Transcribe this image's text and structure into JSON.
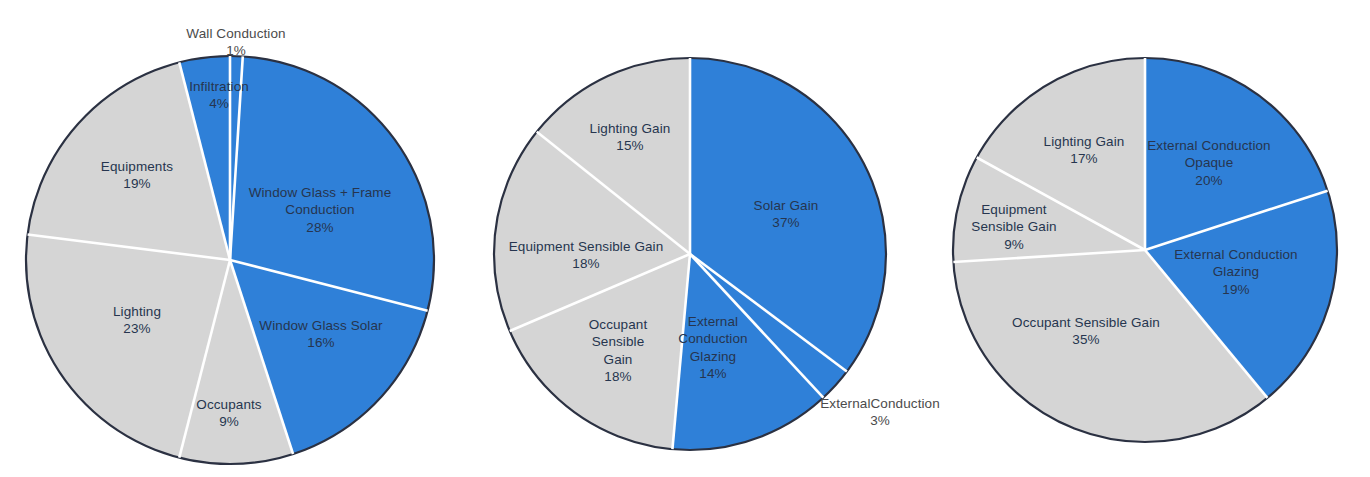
{
  "figure": {
    "background": "#ffffff",
    "colors": {
      "blue": "#2f80d8",
      "gray": "#d5d5d5",
      "outline": "#2b3142",
      "divider": "#ffffff",
      "label_dark": "#26354f",
      "label_outside": "#4b4b4b"
    }
  },
  "chart_data": [
    {
      "type": "pie",
      "title": "",
      "chart_index": 1,
      "name": "heating-load-breakdown",
      "start_angle_deg": 0,
      "direction": "clockwise",
      "legend": "none",
      "labels_inside": true,
      "center": {
        "x": 230,
        "y": 260
      },
      "radius": 204,
      "categories": [
        "Wall Conduction",
        "Window Glass + Frame Conduction",
        "Window Glass Solar",
        "Occupants",
        "Lighting",
        "Equipments",
        "Infiltration"
      ],
      "values": [
        1,
        28,
        16,
        9,
        23,
        19,
        4
      ],
      "value_labels": [
        "1%",
        "28%",
        "16%",
        "9%",
        "23%",
        "19%",
        "4%"
      ],
      "slice_colors": [
        "#2f80d8",
        "#2f80d8",
        "#2f80d8",
        "#d5d5d5",
        "#d5d5d5",
        "#d5d5d5",
        "#2f80d8"
      ],
      "slices": [
        {
          "label": "Wall Conduction",
          "value": 1,
          "pct": "1%",
          "color": "#2f80d8",
          "label_x": 236,
          "label_y": 42,
          "label_align": "center",
          "outside": true
        },
        {
          "label": "Window Glass + Frame Conduction",
          "value": 28,
          "pct": "28%",
          "color": "#2f80d8",
          "label_x": 320,
          "label_y": 210,
          "label_align": "center",
          "label_width": 160,
          "outside": false
        },
        {
          "label": "Window Glass Solar",
          "value": 16,
          "pct": "16%",
          "color": "#2f80d8",
          "label_x": 321,
          "label_y": 334,
          "label_align": "center",
          "outside": false
        },
        {
          "label": "Occupants",
          "value": 9,
          "pct": "9%",
          "color": "#d5d5d5",
          "label_x": 229,
          "label_y": 413,
          "label_align": "center",
          "outside": false
        },
        {
          "label": "Lighting",
          "value": 23,
          "pct": "23%",
          "color": "#d5d5d5",
          "label_x": 137,
          "label_y": 320,
          "label_align": "center",
          "outside": false
        },
        {
          "label": "Equipments",
          "value": 19,
          "pct": "19%",
          "color": "#d5d5d5",
          "label_x": 137,
          "label_y": 175,
          "label_align": "center",
          "outside": false
        },
        {
          "label": "Infiltration",
          "value": 4,
          "pct": "4%",
          "color": "#2f80d8",
          "label_x": 219,
          "label_y": 95,
          "label_align": "center",
          "outside": false
        }
      ]
    },
    {
      "type": "pie",
      "title": "",
      "chart_index": 2,
      "name": "cooling-load-gain-breakdown",
      "start_angle_deg": 0,
      "direction": "clockwise",
      "legend": "none",
      "labels_inside": true,
      "center": {
        "x": 690,
        "y": 254
      },
      "radius": 196,
      "categories": [
        "Solar Gain",
        "ExternalConduction",
        "External Conduction Glazing",
        "Occupant Sensible Gain",
        "Equipment Sensible Gain",
        "Lighting Gain"
      ],
      "values": [
        37,
        3,
        14,
        18,
        18,
        15
      ],
      "value_labels": [
        "37%",
        "3%",
        "14%",
        "18%",
        "18%",
        "15%"
      ],
      "slice_colors": [
        "#2f80d8",
        "#2f80d8",
        "#2f80d8",
        "#d5d5d5",
        "#d5d5d5",
        "#d5d5d5"
      ],
      "slices": [
        {
          "label": "Solar Gain",
          "value": 37,
          "pct": "37%",
          "color": "#2f80d8",
          "label_x": 786,
          "label_y": 214,
          "label_align": "center",
          "outside": false
        },
        {
          "label": "ExternalConduction",
          "value": 3,
          "pct": "3%",
          "color": "#2f80d8",
          "label_x": 880,
          "label_y": 412,
          "label_align": "center",
          "outside": true
        },
        {
          "label": "External Conduction Glazing",
          "value": 14,
          "pct": "14%",
          "color": "#2f80d8",
          "label_x": 713,
          "label_y": 348,
          "label_align": "center",
          "label_width": 100,
          "outside": false
        },
        {
          "label": "Occupant Sensible Gain",
          "value": 18,
          "pct": "18%",
          "color": "#d5d5d5",
          "label_x": 618,
          "label_y": 351,
          "label_align": "center",
          "label_width": 80,
          "outside": false
        },
        {
          "label": "Equipment Sensible Gain",
          "value": 18,
          "pct": "18%",
          "color": "#d5d5d5",
          "label_x": 586,
          "label_y": 255,
          "label_align": "center",
          "outside": false
        },
        {
          "label": "Lighting Gain",
          "value": 15,
          "pct": "15%",
          "color": "#d5d5d5",
          "label_x": 630,
          "label_y": 137,
          "label_align": "center",
          "outside": false
        }
      ]
    },
    {
      "type": "pie",
      "title": "",
      "chart_index": 3,
      "name": "peak-load-breakdown",
      "start_angle_deg": 0,
      "direction": "clockwise",
      "legend": "none",
      "labels_inside": true,
      "center": {
        "x": 1145,
        "y": 250
      },
      "radius": 192,
      "categories": [
        "External Conduction Opaque",
        "External Conduction Glazing",
        "Occupant Sensible Gain",
        "Equipment Sensible Gain",
        "Lighting Gain"
      ],
      "values": [
        20,
        19,
        35,
        9,
        17
      ],
      "value_labels": [
        "20%",
        "19%",
        "35%",
        "9%",
        "17%"
      ],
      "slice_colors": [
        "#2f80d8",
        "#2f80d8",
        "#d5d5d5",
        "#d5d5d5",
        "#d5d5d5"
      ],
      "slices": [
        {
          "label": "External Conduction Opaque",
          "value": 20,
          "pct": "20%",
          "color": "#2f80d8",
          "label_x": 1209,
          "label_y": 163,
          "label_align": "center",
          "label_width": 130,
          "outside": false
        },
        {
          "label": "External Conduction Glazing",
          "value": 19,
          "pct": "19%",
          "color": "#2f80d8",
          "label_x": 1236,
          "label_y": 272,
          "label_align": "center",
          "label_width": 130,
          "outside": false
        },
        {
          "label": "Occupant Sensible Gain",
          "value": 35,
          "pct": "35%",
          "color": "#d5d5d5",
          "label_x": 1086,
          "label_y": 331,
          "label_align": "center",
          "outside": false
        },
        {
          "label": "Equipment Sensible Gain",
          "value": 9,
          "pct": "9%",
          "color": "#d5d5d5",
          "label_x": 1014,
          "label_y": 227,
          "label_align": "center",
          "label_width": 92,
          "outside": false
        },
        {
          "label": "Lighting Gain",
          "value": 17,
          "pct": "17%",
          "color": "#d5d5d5",
          "label_x": 1084,
          "label_y": 150,
          "label_align": "center",
          "outside": false
        }
      ]
    }
  ]
}
